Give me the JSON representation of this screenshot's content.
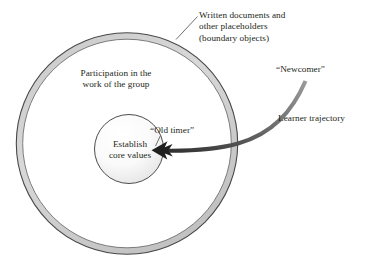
{
  "diagram": {
    "type": "concentric-circles-with-trajectory-arrow",
    "background_color": "#ffffff",
    "text_color": "#231f20",
    "labels": {
      "boundary_objects": "Written documents and\nother placeholders\n(boundary objects)",
      "participation": "Participation in the\nwork of the group",
      "newcomer": "“Newcomer”",
      "learner_trajectory": "Learner trajectory",
      "old_timer": "“Old timer”",
      "core_values": "Establish\ncore values"
    },
    "shapes": {
      "outer_ring": {
        "name": "outer-boundary-ring",
        "center_x": 127,
        "center_y": 143,
        "radius": 108,
        "ring_thickness": 7,
        "fill_color": "#ffffff",
        "ring_fill_color": "#d2d2d2",
        "stroke_color": "#404040"
      },
      "inner_circle": {
        "name": "core-values-circle",
        "center_x": 129,
        "center_y": 149,
        "radius": 35,
        "fill_color": "#fbfbfb",
        "fill_color_shade": "#e6e6e6",
        "stroke_color": "#4a4a4a"
      },
      "trajectory_arrow": {
        "name": "learner-trajectory-arrow",
        "start_x": 305,
        "start_y": 81,
        "end_x": 152,
        "end_y": 150,
        "color": "#3f3f3f",
        "arrowhead": "barbed-left"
      },
      "boundary_leader_line": {
        "name": "boundary-objects-leader-line",
        "from_x": 176,
        "from_y": 39,
        "to_x": 197,
        "to_y": 16,
        "color": "#5a5a5a"
      },
      "old_timer_leader_line": {
        "name": "old-timer-leader-line",
        "from_x": 160,
        "from_y": 136,
        "to_x": 155,
        "to_y": 146,
        "color": "#5a5a5a"
      }
    }
  }
}
